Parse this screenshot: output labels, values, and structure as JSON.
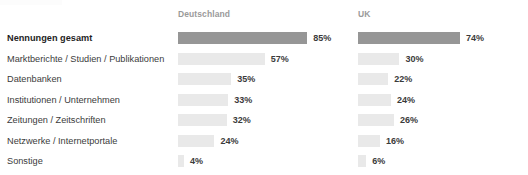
{
  "title_remnant": "",
  "columns": [
    {
      "key": "de",
      "label": "Deutschland"
    },
    {
      "key": "uk",
      "label": "UK"
    }
  ],
  "rows": [
    {
      "label": "Nennungen gesamt",
      "emphasis": true,
      "de": {
        "value": 85,
        "value_label": "85%"
      },
      "uk": {
        "value": 74,
        "value_label": "74%"
      }
    },
    {
      "label": "Marktberichte / Studien / Publikationen",
      "emphasis": false,
      "de": {
        "value": 57,
        "value_label": "57%"
      },
      "uk": {
        "value": 30,
        "value_label": "30%"
      }
    },
    {
      "label": "Datenbanken",
      "emphasis": false,
      "de": {
        "value": 35,
        "value_label": "35%"
      },
      "uk": {
        "value": 22,
        "value_label": "22%"
      }
    },
    {
      "label": "Institutionen / Unternehmen",
      "emphasis": false,
      "de": {
        "value": 33,
        "value_label": "33%"
      },
      "uk": {
        "value": 24,
        "value_label": "24%"
      }
    },
    {
      "label": "Zeitungen / Zeitschriften",
      "emphasis": false,
      "de": {
        "value": 32,
        "value_label": "32%"
      },
      "uk": {
        "value": 26,
        "value_label": "26%"
      }
    },
    {
      "label": "Netzwerke / Internetportale",
      "emphasis": false,
      "de": {
        "value": 24,
        "value_label": "24%"
      },
      "uk": {
        "value": 16,
        "value_label": "16%"
      }
    },
    {
      "label": "Sonstige",
      "emphasis": false,
      "de": {
        "value": 4,
        "value_label": "4%"
      },
      "uk": {
        "value": 6,
        "value_label": "6%"
      }
    }
  ],
  "colors": {
    "bar_default": "#e9e9e9",
    "bar_emphasis": "#969696",
    "label_text": "#3b3b3b",
    "header_text": "#9a9a9a",
    "background": "#ffffff"
  },
  "chart_data": {
    "type": "bar",
    "title": "",
    "xlabel": "",
    "ylabel": "",
    "xlim": [
      0,
      100
    ],
    "grid": false,
    "legend_position": "top",
    "orientation": "horizontal",
    "value_unit": "%",
    "categories": [
      "Nennungen gesamt",
      "Marktberichte / Studien / Publikationen",
      "Datenbanken",
      "Institutionen / Unternehmen",
      "Zeitungen / Zeitschriften",
      "Netzwerke / Internetportale",
      "Sonstige"
    ],
    "series": [
      {
        "name": "Deutschland",
        "values": [
          85,
          57,
          35,
          33,
          32,
          24,
          4
        ]
      },
      {
        "name": "UK",
        "values": [
          74,
          30,
          22,
          24,
          26,
          16,
          6
        ]
      }
    ]
  }
}
